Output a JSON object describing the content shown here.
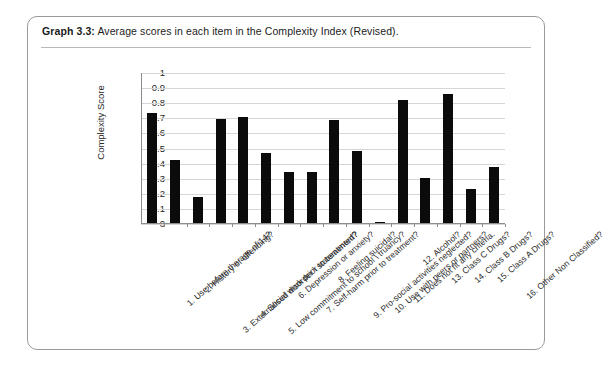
{
  "caption": {
    "label": "Graph 3.3:",
    "text": "Average scores in each item in the Complexity Index (Revised)."
  },
  "chart_data": {
    "type": "bar",
    "title": "Average scores in each item in the Complexity Index (Revised).",
    "xlabel": "",
    "ylabel": "Complexity Score",
    "ylim": [
      0,
      1
    ],
    "ytick_labels": [
      "1",
      "0.9",
      "0.8",
      "0.7",
      "0.6",
      "0.5",
      "0.4",
      "0.3",
      "0.2",
      "0.1",
      "0"
    ],
    "ytick_values": [
      1,
      0.9,
      0.8,
      0.7,
      0.6,
      0.5,
      0.4,
      0.3,
      0.2,
      0.1,
      0
    ],
    "grid": true,
    "legend": false,
    "bar_color": "#0b0b0b",
    "categories": [
      "1. Use before the age of 14?",
      "2. History of offending?",
      "3. Externalised disorder \\ statemented?",
      "4. Social work prior to treatment?",
      "5. Low commitment to school \\ truancy?",
      "6. Depression or anxiety?",
      "7. Self-harm prior to treatment?",
      "8. Feeling suicidal?",
      "9. Pro-social activities neglected?",
      "10. Use with peers or partners?",
      "11. Does not fit any criteria.",
      "12. Alcohol?",
      "13. Class C Drugs?",
      "14. Class B Drugs?",
      "15. Class A Drugs?",
      "16. Other Non Classified?"
    ],
    "values": [
      0.73,
      0.42,
      0.175,
      0.69,
      0.7,
      0.465,
      0.335,
      0.335,
      0.685,
      0.475,
      0.01,
      0.815,
      0.295,
      0.855,
      0.225,
      0.37
    ]
  }
}
